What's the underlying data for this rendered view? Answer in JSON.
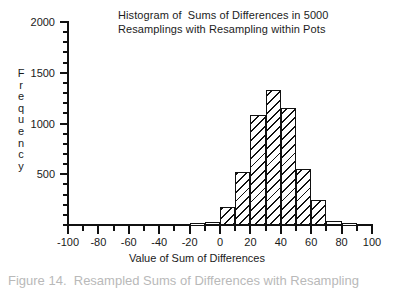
{
  "chart_data": {
    "type": "bar",
    "title": "Histogram of  Sums of Differences in 5000\nResamplings with Resampling within Pots",
    "title_lines": [
      "Histogram of  Sums of Differences in 5000",
      "Resamplings with Resampling within Pots"
    ],
    "xlabel": "Value of Sum of Differences",
    "ylabel": "Frequency",
    "ylabel_chars": [
      "F",
      "r",
      "e",
      "q",
      "u",
      "e",
      "n",
      "c",
      "y"
    ],
    "xlim": [
      -100,
      100
    ],
    "ylim": [
      0,
      2000
    ],
    "grid": false,
    "legend": null,
    "bin_width": 10,
    "x_major_ticks": [
      -100,
      -80,
      -60,
      -40,
      -20,
      0,
      20,
      40,
      60,
      80,
      100
    ],
    "x_major_tick_labels": [
      "-100",
      "-80",
      "-60",
      "-40",
      "-20",
      "0",
      "20",
      "40",
      "60",
      "80",
      "100"
    ],
    "x_minor_tick_step": 10,
    "y_major_ticks": [
      500,
      1000,
      1500,
      2000
    ],
    "y_major_tick_labels": [
      "500",
      "1000",
      "1500",
      "2000"
    ],
    "y_minor_tick_step": 100,
    "bin_starts": [
      -20,
      -10,
      0,
      10,
      20,
      30,
      40,
      50,
      60,
      70,
      80
    ],
    "categories": [
      "-20",
      "-10",
      "0",
      "10",
      "20",
      "30",
      "40",
      "50",
      "60",
      "70",
      "80"
    ],
    "values": [
      20,
      30,
      180,
      520,
      1080,
      1330,
      1150,
      550,
      250,
      40,
      20
    ],
    "bar_style": {
      "fill": "diagonal-hatch",
      "hatch_color": "#111111",
      "face_color": "#ffffff",
      "edge_color": "#111111"
    }
  },
  "caption": {
    "remnant": "Figure 14.  Resampled Sums of Differences with Resampling"
  },
  "colors": {
    "axis": "#111111",
    "text": "#1c1c1c",
    "background": "#ffffff"
  }
}
